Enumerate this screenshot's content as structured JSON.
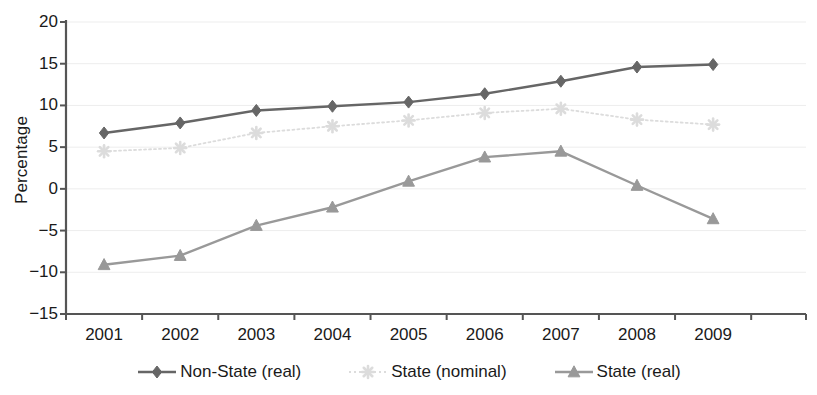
{
  "chart_data": {
    "type": "line",
    "title": "",
    "xlabel": "",
    "ylabel": "Percentage",
    "categories": [
      "2001",
      "2002",
      "2003",
      "2004",
      "2005",
      "2006",
      "2007",
      "2008",
      "2009"
    ],
    "ylim": [
      -15,
      20
    ],
    "yticks": [
      20,
      15,
      10,
      5,
      0,
      -5,
      -10,
      -15
    ],
    "ytick_labels": [
      "20",
      "15",
      "10",
      "5",
      "0",
      "−5",
      "−10",
      "−15"
    ],
    "grid": true,
    "legend_position": "bottom",
    "series": [
      {
        "name": "Non-State (real)",
        "marker": "diamond",
        "line_style": "solid",
        "color": "#666666",
        "values": [
          6.7,
          7.9,
          9.4,
          9.9,
          10.4,
          11.4,
          12.9,
          14.6,
          14.9
        ]
      },
      {
        "name": "State (nominal)",
        "marker": "star",
        "line_style": "dotted",
        "color": "#dcdcdc",
        "values": [
          4.5,
          4.9,
          6.7,
          7.5,
          8.2,
          9.1,
          9.6,
          8.3,
          7.7
        ]
      },
      {
        "name": "State (real)",
        "marker": "triangle",
        "line_style": "solid",
        "color": "#999999",
        "values": [
          -9.1,
          -8.0,
          -4.4,
          -2.2,
          0.9,
          3.8,
          4.5,
          0.4,
          -3.6
        ]
      }
    ]
  },
  "axis": {
    "line_color": "#555555",
    "grid_color": "#ededed"
  }
}
